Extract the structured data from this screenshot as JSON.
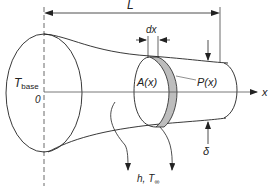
{
  "diagram": {
    "labels": {
      "length": "L",
      "element_width": "dx",
      "base_temp_main": "T",
      "base_temp_sub": "base",
      "origin": "0",
      "area": "A(x)",
      "perimeter": "P(x)",
      "axis": "x",
      "thickness": "δ",
      "convection_h": "h,",
      "convection_T": "T",
      "convection_T_sub": "∞"
    },
    "colors": {
      "line": "#222222",
      "shaded_band": "#bdbdbd",
      "axis": "#444444"
    }
  }
}
